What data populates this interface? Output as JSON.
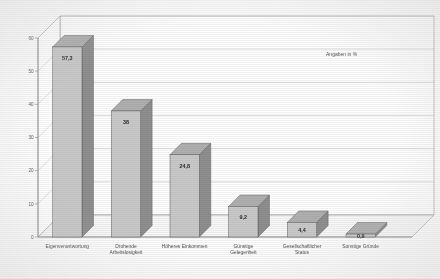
{
  "chart_data": {
    "type": "bar",
    "title": "",
    "subtitle": "",
    "annotation": "Angaben in %",
    "xlabel": "",
    "ylabel": "",
    "ylim": [
      0,
      60
    ],
    "yticks": [
      "0",
      "10",
      "20",
      "30",
      "40",
      "50",
      "60"
    ],
    "grid": true,
    "legend": "none",
    "style": "3d-bar-grayscale",
    "categories": [
      "Eigenverantwortung",
      "Drohende Arbeitslosigkeit",
      "Höheres Einkommen",
      "Günstige Gelegenheit",
      "Gesellschaftlicher Status",
      "Sonstige Gründe"
    ],
    "values": [
      57.3,
      38,
      24.8,
      9.2,
      4.4,
      0.9
    ],
    "value_labels": [
      "57,3",
      "38",
      "24,8",
      "9,2",
      "4,4",
      "0,9"
    ],
    "category_lines": [
      [
        "Eigenverantwortung"
      ],
      [
        "Drohende",
        "Arbeitslosigkeit"
      ],
      [
        "Höheres Einkommen"
      ],
      [
        "Günstige",
        "Gelegenheit"
      ],
      [
        "Gesellschaftlicher",
        "Status"
      ],
      [
        "Sonstige Gründe"
      ]
    ]
  },
  "colors": {
    "bar_front": "#c9c9c9",
    "bar_side": "#8f8f8f",
    "bar_top": "#b0b0b0",
    "bar_outline": "#5e5e5e",
    "grid": "#c0c0c0",
    "axis": "#8a8a8a",
    "floor": "#f7f7f7",
    "text": "#4a4a4a",
    "background": "#fdfdfd"
  },
  "axis": {
    "y_ticks": [
      "60",
      "50",
      "40",
      "30",
      "20",
      "10",
      "0"
    ]
  }
}
